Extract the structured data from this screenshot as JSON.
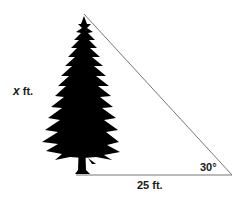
{
  "diagram": {
    "type": "right-triangle-word-problem",
    "height_label": {
      "variable": "x",
      "unit": " ft."
    },
    "base_label": "25 ft.",
    "angle_label": "30°",
    "colors": {
      "line": "#777777",
      "tree": "#000000",
      "text": "#1a1a1a",
      "background": "#ffffff"
    }
  }
}
